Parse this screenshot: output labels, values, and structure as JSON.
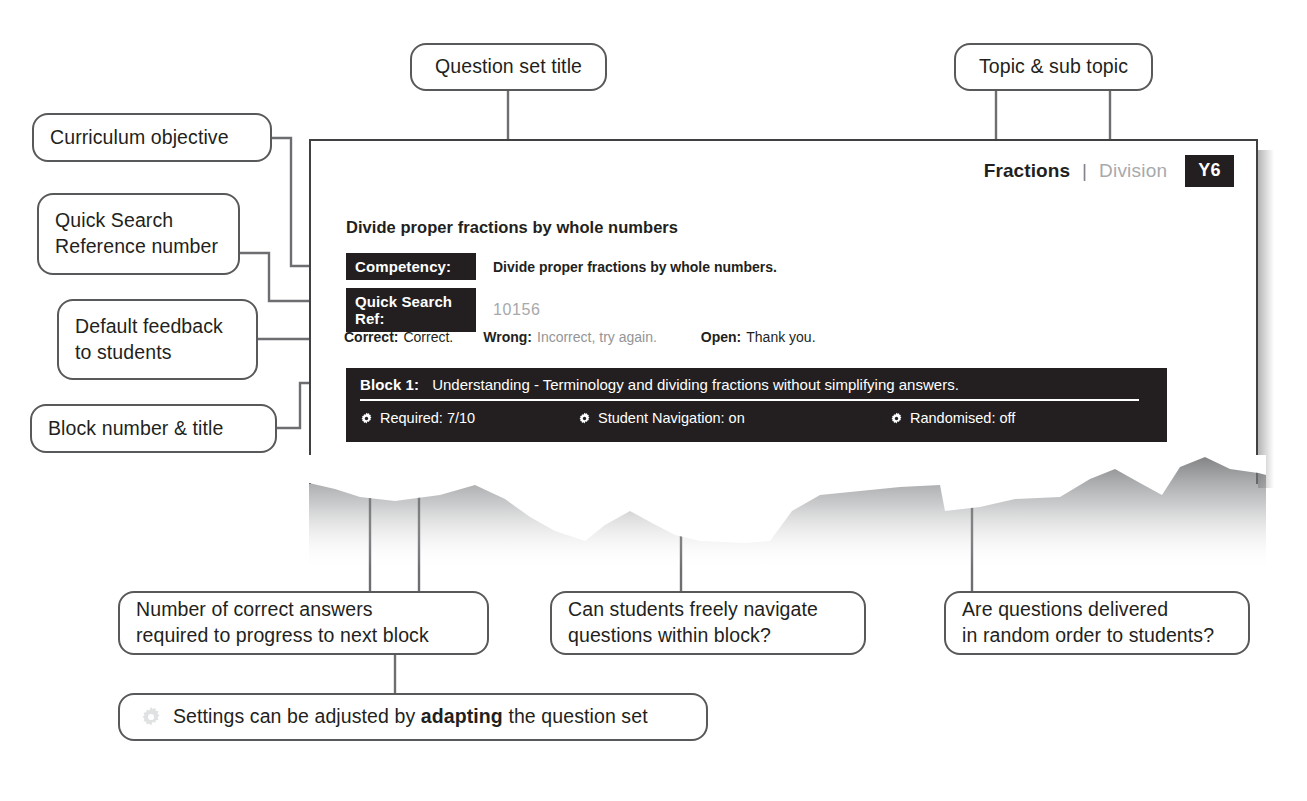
{
  "callouts": {
    "question_set_title": "Question set title",
    "topic_sub_topic": "Topic & sub topic",
    "curriculum_objective": "Curriculum objective",
    "quick_search_ref_line1": "Quick Search",
    "quick_search_ref_line2": "Reference number",
    "default_feedback_line1": "Default feedback",
    "default_feedback_line2": "to students",
    "block_number_title": "Block number & title",
    "required_line1": "Number of correct answers",
    "required_line2": "required to progress to next block",
    "navigation_line1": "Can students freely navigate",
    "navigation_line2": "questions within block?",
    "randomised_line1": "Are questions delivered",
    "randomised_line2": "in random order to students?",
    "settings_note_pre": "Settings can be adjusted by ",
    "settings_note_bold": "adapting",
    "settings_note_post": " the question set"
  },
  "document": {
    "header": {
      "topic": "Fractions",
      "separator": "|",
      "sub_topic": "Division",
      "year_badge": "Y6"
    },
    "question_set_title": "Divide proper fractions by whole numbers",
    "fields": [
      {
        "label": "Competency:",
        "value": "Divide proper fractions by whole numbers.",
        "muted": false
      },
      {
        "label": "Quick Search Ref:",
        "value": "10156",
        "muted": true
      }
    ],
    "feedback": [
      {
        "key": "Correct:",
        "value": "Correct.",
        "grey": false
      },
      {
        "key": "Wrong:",
        "value": "Incorrect, try again.",
        "grey": true
      },
      {
        "key": "Open:",
        "value": "Thank you.",
        "grey": false
      }
    ],
    "block": {
      "number": "Block 1:",
      "title": "Understanding - Terminology and dividing fractions without simplifying answers.",
      "settings": [
        {
          "icon": "gear-icon",
          "label": "Required: 7/10"
        },
        {
          "icon": "gear-icon",
          "label": "Student Navigation: on"
        },
        {
          "icon": "gear-icon",
          "label": "Randomised: off"
        }
      ]
    }
  },
  "colors": {
    "ink": "#231f20",
    "panel_border": "#414042",
    "callout_border": "#58595b",
    "muted_text": "#a7a9ac",
    "grey_text": "#939598",
    "connector": "#6d6e71",
    "black_fill": "#231f20"
  }
}
